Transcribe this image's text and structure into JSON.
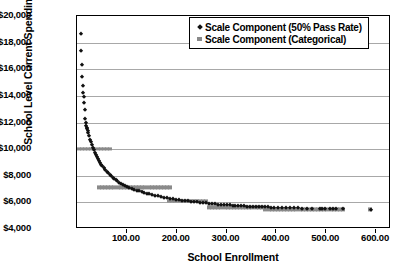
{
  "chart_data": {
    "type": "scatter",
    "title": "",
    "xlabel": "School Enrollment",
    "ylabel": "School Level Current Spending/Cost",
    "xlim": [
      0,
      630
    ],
    "ylim": [
      4000,
      20000
    ],
    "xticks": [
      "100.00",
      "200.00",
      "300.00",
      "400.00",
      "500.00",
      "600.00"
    ],
    "xtick_values": [
      100,
      200,
      300,
      400,
      500,
      600
    ],
    "yticks": [
      "$4,000",
      "$6,000",
      "$8,000",
      "$10,000",
      "$12,000",
      "$14,000",
      "$16,000",
      "$18,000",
      "$20,000"
    ],
    "ytick_values": [
      4000,
      6000,
      8000,
      10000,
      12000,
      14000,
      16000,
      18000,
      20000
    ],
    "grid": "horizontal",
    "legend_position": "top-right",
    "series": [
      {
        "name": "Scale Component (50% Pass Rate)",
        "marker": "diamond",
        "color": "#111111",
        "points": [
          [
            8,
            18650
          ],
          [
            9,
            17350
          ],
          [
            10,
            16300
          ],
          [
            11,
            15450
          ],
          [
            12,
            14750
          ],
          [
            13,
            14250
          ],
          [
            14,
            13950
          ],
          [
            15,
            13450
          ],
          [
            16,
            12950
          ],
          [
            17,
            12250
          ],
          [
            18,
            11950
          ],
          [
            19,
            11750
          ],
          [
            20,
            11600
          ],
          [
            21,
            11500
          ],
          [
            22,
            11350
          ],
          [
            23,
            11200
          ],
          [
            25,
            10950
          ],
          [
            27,
            10700
          ],
          [
            29,
            10500
          ],
          [
            31,
            10300
          ],
          [
            33,
            10100
          ],
          [
            35,
            9900
          ],
          [
            37,
            9700
          ],
          [
            39,
            9550
          ],
          [
            41,
            9400
          ],
          [
            43,
            9250
          ],
          [
            45,
            9100
          ],
          [
            47,
            8950
          ],
          [
            49,
            8820
          ],
          [
            51,
            8700
          ],
          [
            54,
            8560
          ],
          [
            57,
            8420
          ],
          [
            60,
            8290
          ],
          [
            63,
            8170
          ],
          [
            66,
            8060
          ],
          [
            69,
            7950
          ],
          [
            72,
            7850
          ],
          [
            75,
            7760
          ],
          [
            78,
            7670
          ],
          [
            81,
            7590
          ],
          [
            85,
            7490
          ],
          [
            89,
            7400
          ],
          [
            93,
            7320
          ],
          [
            97,
            7240
          ],
          [
            101,
            7170
          ],
          [
            105,
            7100
          ],
          [
            110,
            7020
          ],
          [
            115,
            6950
          ],
          [
            120,
            6880
          ],
          [
            125,
            6820
          ],
          [
            130,
            6760
          ],
          [
            135,
            6700
          ],
          [
            140,
            6650
          ],
          [
            145,
            6600
          ],
          [
            150,
            6550
          ],
          [
            156,
            6500
          ],
          [
            162,
            6450
          ],
          [
            168,
            6400
          ],
          [
            174,
            6360
          ],
          [
            180,
            6320
          ],
          [
            186,
            6280
          ],
          [
            192,
            6240
          ],
          [
            198,
            6200
          ],
          [
            204,
            6170
          ],
          [
            210,
            6140
          ],
          [
            216,
            6110
          ],
          [
            222,
            6080
          ],
          [
            228,
            6050
          ],
          [
            234,
            6020
          ],
          [
            240,
            5995
          ],
          [
            246,
            5970
          ],
          [
            252,
            5945
          ],
          [
            258,
            5920
          ],
          [
            264,
            5900
          ],
          [
            270,
            5880
          ],
          [
            276,
            5860
          ],
          [
            282,
            5840
          ],
          [
            288,
            5820
          ],
          [
            294,
            5800
          ],
          [
            300,
            5785
          ],
          [
            306,
            5770
          ],
          [
            312,
            5755
          ],
          [
            318,
            5740
          ],
          [
            324,
            5725
          ],
          [
            330,
            5710
          ],
          [
            336,
            5700
          ],
          [
            342,
            5688
          ],
          [
            348,
            5676
          ],
          [
            354,
            5664
          ],
          [
            360,
            5654
          ],
          [
            366,
            5644
          ],
          [
            372,
            5634
          ],
          [
            378,
            5625
          ],
          [
            384,
            5616
          ],
          [
            390,
            5608
          ],
          [
            396,
            5600
          ],
          [
            404,
            5590
          ],
          [
            412,
            5580
          ],
          [
            420,
            5570
          ],
          [
            428,
            5562
          ],
          [
            436,
            5554
          ],
          [
            444,
            5546
          ],
          [
            452,
            5538
          ],
          [
            462,
            5528
          ],
          [
            472,
            5520
          ],
          [
            487,
            5505
          ],
          [
            492,
            5500
          ],
          [
            497,
            5498
          ],
          [
            508,
            5490
          ],
          [
            513,
            5486
          ],
          [
            519,
            5482
          ],
          [
            533,
            5472
          ],
          [
            590,
            5430
          ]
        ]
      },
      {
        "name": "Scale Component (Categorical)",
        "marker": "square",
        "color": "#8a8a8a",
        "steps": [
          {
            "x_start": 4,
            "x_end": 72,
            "value": 10000
          },
          {
            "x_start": 44,
            "x_end": 190,
            "value": 7120
          },
          {
            "x_start": 185,
            "x_end": 262,
            "value": 6100
          },
          {
            "x_start": 265,
            "x_end": 373,
            "value": 5620
          },
          {
            "x_start": 378,
            "x_end": 538,
            "value": 5470
          },
          {
            "x_start": 588,
            "x_end": 592,
            "value": 5470
          }
        ]
      }
    ]
  }
}
